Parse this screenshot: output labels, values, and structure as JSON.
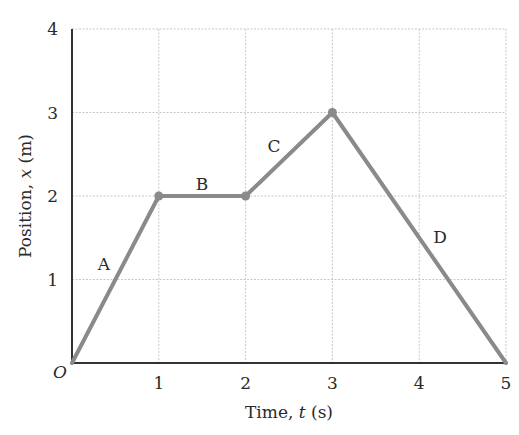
{
  "chart_data": {
    "type": "line",
    "title": "",
    "xlabel": "Time, t (s)",
    "ylabel": "Position, x (m)",
    "xlim": [
      0,
      5
    ],
    "ylim": [
      0,
      4
    ],
    "x_ticks": [
      "1",
      "2",
      "3",
      "4",
      "5"
    ],
    "y_ticks": [
      "1",
      "2",
      "3",
      "4"
    ],
    "origin_label": "O",
    "grid": true,
    "legend": null,
    "series": [
      {
        "name": "position",
        "color": "#8a8a8a",
        "x": [
          0,
          1,
          2,
          3,
          5
        ],
        "y": [
          0,
          2,
          2,
          3,
          0
        ]
      }
    ],
    "segments": [
      {
        "label": "A",
        "from": [
          0,
          0
        ],
        "to": [
          1,
          2
        ]
      },
      {
        "label": "B",
        "from": [
          1,
          2
        ],
        "to": [
          2,
          2
        ]
      },
      {
        "label": "C",
        "from": [
          2,
          2
        ],
        "to": [
          3,
          3
        ]
      },
      {
        "label": "D",
        "from": [
          3,
          3
        ],
        "to": [
          5,
          0
        ]
      }
    ],
    "vertex_markers": [
      [
        1,
        2
      ],
      [
        2,
        2
      ],
      [
        3,
        3
      ]
    ]
  },
  "labels": {
    "xlabel_prefix": "Time, ",
    "xlabel_var": "t",
    "xlabel_suffix": " (s)",
    "ylabel_prefix": "Position, ",
    "ylabel_var": "x",
    "ylabel_suffix": " (m)"
  }
}
